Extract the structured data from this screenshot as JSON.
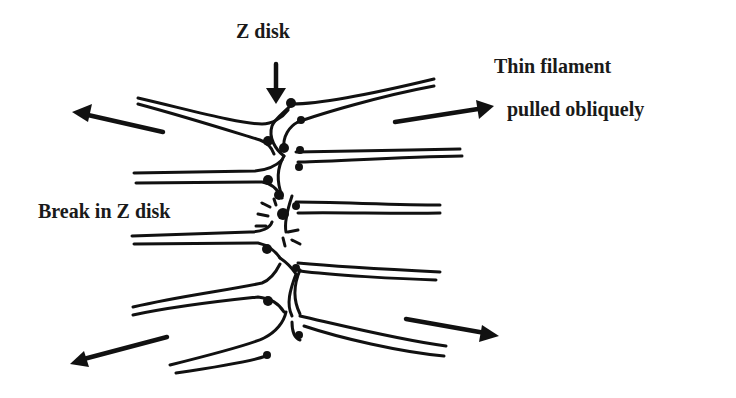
{
  "diagram": {
    "labels": {
      "z_disk": "Z disk",
      "thin_filament_line1": "Thin filament",
      "thin_filament_line2": "pulled obliquely",
      "break": "Break in Z disk"
    },
    "arrows": [
      {
        "id": "z-disk-pointer",
        "direction": "down"
      },
      {
        "id": "pull-upper-left",
        "direction": "left-up"
      },
      {
        "id": "pull-upper-right",
        "direction": "right-up"
      },
      {
        "id": "pull-lower-left",
        "direction": "left-down"
      },
      {
        "id": "pull-lower-right",
        "direction": "right-down"
      }
    ],
    "colors": {
      "ink": "#111111",
      "background": "#ffffff"
    }
  }
}
